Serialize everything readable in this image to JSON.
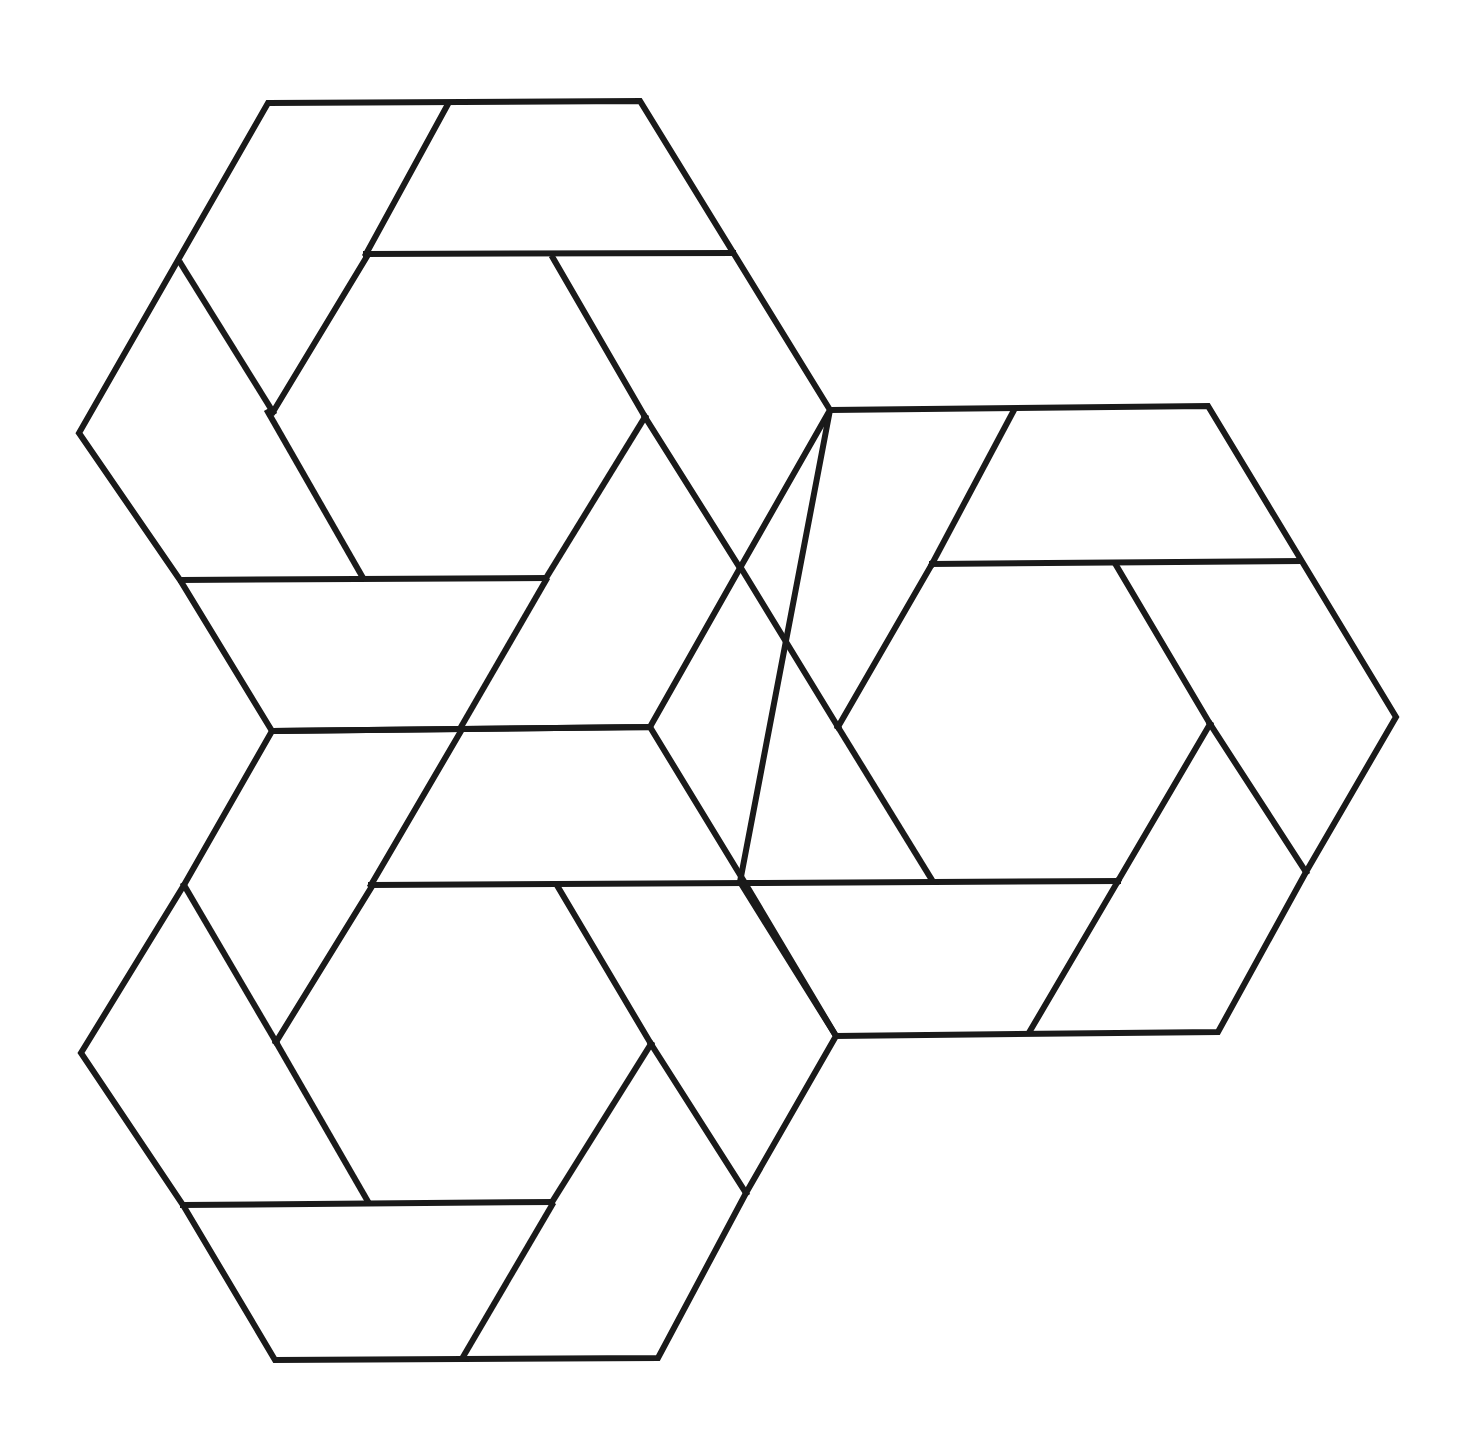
{
  "figure": {
    "stroke_color": "#1a1a1a",
    "background_color": "#ffffff",
    "stroke_width": 6,
    "hexagons": [
      {
        "name": "top-left-hexagon",
        "outer": [
          [
            268,
            103
          ],
          [
            640,
            101
          ],
          [
            830,
            410
          ],
          [
            740,
            568
          ],
          [
            650,
            727
          ],
          [
            272,
            731
          ],
          [
            180,
            580
          ],
          [
            79,
            433
          ]
        ],
        "segments": [
          [
            [
              448,
              104
            ],
            [
              366,
              254
            ]
          ],
          [
            [
              366,
              254
            ],
            [
              733,
              253
            ]
          ],
          [
            [
              181,
              264
            ],
            [
              273,
              412
            ]
          ],
          [
            [
              273,
              412
            ],
            [
              366,
              258
            ]
          ],
          [
            [
              268,
              412
            ],
            [
              363,
              578
            ]
          ],
          [
            [
              181,
              580
            ],
            [
              546,
              578
            ]
          ],
          [
            [
              546,
              578
            ],
            [
              645,
              417
            ]
          ],
          [
            [
              461,
              727
            ],
            [
              546,
              580
            ]
          ],
          [
            [
              553,
              258
            ],
            [
              645,
              417
            ]
          ],
          [
            [
              645,
              417
            ],
            [
              740,
              568
            ]
          ]
        ]
      },
      {
        "name": "right-hexagon",
        "outer": [
          [
            830,
            410
          ],
          [
            1208,
            406
          ],
          [
            1396,
            717
          ],
          [
            1306,
            872
          ],
          [
            1218,
            1032
          ],
          [
            836,
            1036
          ],
          [
            740,
            882
          ]
        ],
        "segments": [
          [
            [
              1014,
              410
            ],
            [
              932,
              564
            ]
          ],
          [
            [
              932,
              564
            ],
            [
              1300,
              561
            ]
          ],
          [
            [
              932,
              564
            ],
            [
              838,
              727
            ]
          ],
          [
            [
              741,
              568
            ],
            [
              838,
              727
            ]
          ],
          [
            [
              838,
              727
            ],
            [
              932,
              880
            ]
          ],
          [
            [
              1116,
              565
            ],
            [
              1210,
              724
            ]
          ],
          [
            [
              1210,
              724
            ],
            [
              1306,
              872
            ]
          ],
          [
            [
              1210,
              724
            ],
            [
              1118,
              881
            ]
          ],
          [
            [
              745,
              883
            ],
            [
              1118,
              881
            ]
          ],
          [
            [
              1118,
              881
            ],
            [
              1030,
              1031
            ]
          ]
        ]
      },
      {
        "name": "bottom-left-hexagon",
        "outer": [
          [
            272,
            731
          ],
          [
            650,
            727
          ],
          [
            745,
            883
          ],
          [
            836,
            1036
          ],
          [
            746,
            1193
          ],
          [
            658,
            1358
          ],
          [
            275,
            1360
          ],
          [
            183,
            1205
          ],
          [
            81,
            1053
          ],
          [
            184,
            885
          ]
        ],
        "segments": [
          [
            [
              461,
              731
            ],
            [
              371,
              885
            ]
          ],
          [
            [
              371,
              885
            ],
            [
              745,
              883
            ]
          ],
          [
            [
              184,
              885
            ],
            [
              276,
              1042
            ]
          ],
          [
            [
              276,
              1042
            ],
            [
              371,
              888
            ]
          ],
          [
            [
              276,
              1042
            ],
            [
              367,
              1200
            ]
          ],
          [
            [
              183,
              1205
            ],
            [
              552,
              1202
            ]
          ],
          [
            [
              552,
              1202
            ],
            [
              651,
              1044
            ]
          ],
          [
            [
              463,
              1357
            ],
            [
              552,
              1205
            ]
          ],
          [
            [
              558,
              887
            ],
            [
              651,
              1044
            ]
          ],
          [
            [
              651,
              1044
            ],
            [
              746,
              1193
            ]
          ]
        ]
      }
    ]
  }
}
